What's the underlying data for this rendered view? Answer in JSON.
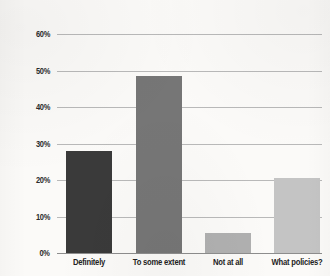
{
  "chart_data": {
    "type": "bar",
    "title": "",
    "subtitle": "",
    "xlabel": "",
    "ylabel": "",
    "categories": [
      "Definitely",
      "To some extent",
      "Not at all",
      "What policies?"
    ],
    "values": [
      28,
      48.5,
      5.5,
      20.5
    ],
    "value_labels": [
      "28%",
      "48.5%",
      "5.5%",
      "20.5%"
    ],
    "bar_colors": [
      "#3a3a3a",
      "#767676",
      "#b0b0b0",
      "#c4c4c4"
    ],
    "ylim": [
      0,
      60
    ],
    "ytick_values": [
      0,
      10,
      20,
      30,
      40,
      50,
      60
    ],
    "ytick_labels": [
      "0%",
      "10%",
      "20%",
      "30%",
      "40%",
      "50%",
      "60%"
    ],
    "grid": true,
    "grid_color": "#b9b9b9",
    "legend": "none",
    "background_color": "#fbfaf8",
    "annotations": []
  },
  "axis": {
    "y": {
      "ticks": [
        {
          "label": "60%",
          "value": 60
        },
        {
          "label": "50%",
          "value": 50
        },
        {
          "label": "40%",
          "value": 40
        },
        {
          "label": "30%",
          "value": 30
        },
        {
          "label": "20%",
          "value": 20
        },
        {
          "label": "10%",
          "value": 10
        },
        {
          "label": "0%",
          "value": 0
        }
      ]
    },
    "x": {
      "ticks": [
        {
          "label": "Definitely"
        },
        {
          "label": "To some extent"
        },
        {
          "label": "Not at all"
        },
        {
          "label": "What policies?"
        }
      ]
    }
  }
}
